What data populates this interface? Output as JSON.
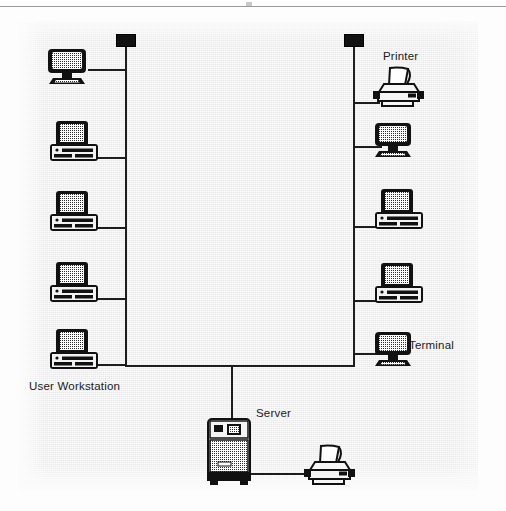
{
  "page": {
    "background_color": "#e9e9e9",
    "ink_color": "#1d1d1d",
    "page_rule": true
  },
  "diagram": {
    "type": "network-topology",
    "topology": "dual-bus",
    "labels": [
      {
        "id": "user-workstation",
        "text": "User Workstation",
        "x": 29,
        "y": 380
      },
      {
        "id": "printer",
        "text": "Printer",
        "x": 383,
        "y": 52
      },
      {
        "id": "terminal",
        "text": "Terminal",
        "x": 409,
        "y": 340
      },
      {
        "id": "server",
        "text": "Server",
        "x": 256,
        "y": 408
      }
    ],
    "terminators": [
      {
        "id": "left-bus-terminator",
        "x": 116,
        "y": 34
      },
      {
        "id": "right-bus-terminator",
        "x": 344,
        "y": 34
      }
    ],
    "buses": [
      {
        "id": "left-bus",
        "orientation": "vertical",
        "x": 125,
        "y1": 47,
        "y2": 366
      },
      {
        "id": "right-bus",
        "orientation": "vertical",
        "x": 353,
        "y1": 47,
        "y2": 366
      },
      {
        "id": "trunk",
        "orientation": "horizontal",
        "y": 365,
        "x1": 125,
        "x2": 353
      },
      {
        "id": "server-drop",
        "orientation": "vertical",
        "x": 232,
        "y1": 365,
        "y2": 418
      },
      {
        "id": "server-printer-link",
        "orientation": "horizontal",
        "y": 474,
        "x1": 232,
        "x2": 312
      }
    ],
    "nodes": [
      {
        "id": "left-node-1",
        "kind": "crt-monitor",
        "label": null,
        "x": 48,
        "y": 47,
        "drop_y": 70,
        "bus": "left-bus"
      },
      {
        "id": "left-node-2",
        "kind": "workstation",
        "label": null,
        "x": 50,
        "y": 122,
        "drop_y": 158,
        "bus": "left-bus"
      },
      {
        "id": "left-node-3",
        "kind": "workstation",
        "label": null,
        "x": 50,
        "y": 192,
        "drop_y": 228,
        "bus": "left-bus"
      },
      {
        "id": "left-node-4",
        "kind": "workstation",
        "label": null,
        "x": 50,
        "y": 263,
        "drop_y": 299,
        "bus": "left-bus"
      },
      {
        "id": "left-node-5",
        "kind": "workstation",
        "label": "User Workstation",
        "x": 50,
        "y": 333,
        "drop_y": 366,
        "bus": "left-bus"
      },
      {
        "id": "right-node-1",
        "kind": "printer",
        "label": "Printer",
        "x": 375,
        "y": 66,
        "drop_y": 103,
        "bus": "right-bus"
      },
      {
        "id": "right-node-2",
        "kind": "crt-monitor",
        "label": null,
        "x": 375,
        "y": 123,
        "drop_y": 147,
        "bus": "right-bus"
      },
      {
        "id": "right-node-3",
        "kind": "workstation",
        "label": null,
        "x": 375,
        "y": 188,
        "drop_y": 224,
        "bus": "right-bus"
      },
      {
        "id": "right-node-4",
        "kind": "workstation",
        "label": null,
        "x": 375,
        "y": 264,
        "drop_y": 300,
        "bus": "right-bus"
      },
      {
        "id": "right-node-5",
        "kind": "crt-terminal",
        "label": "Terminal",
        "x": 375,
        "y": 333,
        "drop_y": 355,
        "bus": "right-bus"
      },
      {
        "id": "server",
        "kind": "server-tower",
        "label": "Server",
        "x": 208,
        "y": 418,
        "drop_y": 418,
        "bus": "server-drop"
      },
      {
        "id": "server-printer",
        "kind": "printer",
        "label": null,
        "x": 305,
        "y": 447,
        "drop_y": 474,
        "bus": "server-printer-link"
      }
    ]
  }
}
